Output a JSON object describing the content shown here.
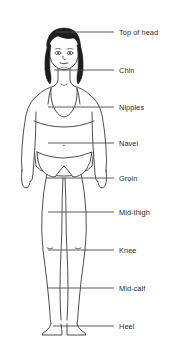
{
  "diagram": {
    "background_color": "#ffffff",
    "line_color": "#3a3a3a",
    "text_color": "#2b2b2b",
    "hair_color": "#1e1e1e",
    "skin_fill": "#ffffff",
    "width": 176,
    "height": 345,
    "callouts": [
      {
        "id": "top-of-head",
        "label": "Top of head",
        "line_y": 32,
        "line_x_start": 56,
        "line_x_end": 114,
        "text_x": 119
      },
      {
        "id": "chin",
        "label": "Chin",
        "line_y": 70,
        "line_x_start": 54,
        "line_x_end": 114,
        "text_x": 119
      },
      {
        "id": "nipples",
        "label": "Nipples",
        "line_y": 107,
        "line_x_start": 48,
        "line_x_end": 114,
        "text_x": 119
      },
      {
        "id": "navel",
        "label": "Navel",
        "line_y": 143,
        "line_x_start": 48,
        "line_x_end": 114,
        "text_x": 119
      },
      {
        "id": "groin",
        "label": "Groin",
        "line_y": 178,
        "line_x_start": 46,
        "line_x_end": 114,
        "text_x": 119
      },
      {
        "id": "mid-thigh",
        "label": "Mid-thigh",
        "line_y": 212,
        "line_x_start": 48,
        "line_x_end": 114,
        "text_x": 119
      },
      {
        "id": "knee",
        "label": "Knee",
        "line_y": 250,
        "line_x_start": 48,
        "line_x_end": 114,
        "text_x": 119
      },
      {
        "id": "mid-calf",
        "label": "Mid-calf",
        "line_y": 288,
        "line_x_start": 48,
        "line_x_end": 114,
        "text_x": 119
      },
      {
        "id": "heel",
        "label": "Heel",
        "line_y": 326,
        "line_x_start": 53,
        "line_x_end": 114,
        "text_x": 119
      }
    ]
  }
}
